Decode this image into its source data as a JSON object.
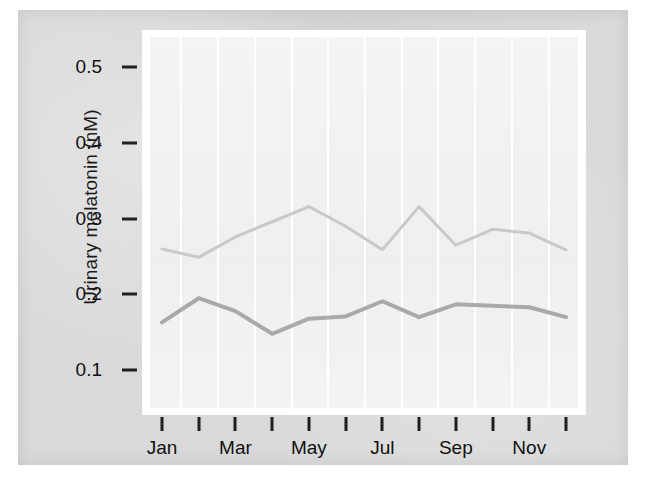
{
  "figure": {
    "background_color": "#d9d9d9",
    "plot_background_color": "#f2f2f2",
    "gridline_color": "#ffffff"
  },
  "chart_data": {
    "type": "line",
    "title": "",
    "xlabel": "",
    "ylabel": "Urinary melatonin (nM)",
    "ylim": [
      0.05,
      0.54
    ],
    "yticks": [
      "0.1",
      "0.2",
      "0.3",
      "0.4",
      "0.5"
    ],
    "ytick_values": [
      0.1,
      0.2,
      0.3,
      0.4,
      0.5
    ],
    "xlim": [
      0.5,
      12.5
    ],
    "categories": [
      "Jan",
      "Feb",
      "Mar",
      "Apr",
      "May",
      "Jun",
      "Jul",
      "Aug",
      "Sep",
      "Oct",
      "Nov",
      "Dec"
    ],
    "xtick_labels_shown": [
      "Jan",
      "",
      "Mar",
      "",
      "May",
      "",
      "Jul",
      "",
      "Sep",
      "",
      "Nov",
      ""
    ],
    "grid": "vertical",
    "legend": "none",
    "series": [
      {
        "name": "upper",
        "color": "#c9c9c9",
        "linewidth": 3,
        "values": [
          0.26,
          0.249,
          0.276,
          0.296,
          0.316,
          0.29,
          0.259,
          0.316,
          0.265,
          0.286,
          0.281,
          0.259
        ]
      },
      {
        "name": "lower",
        "color": "#a9a9a9",
        "linewidth": 4,
        "values": [
          0.163,
          0.195,
          0.178,
          0.148,
          0.168,
          0.171,
          0.191,
          0.17,
          0.187,
          0.185,
          0.183,
          0.17
        ]
      }
    ]
  }
}
